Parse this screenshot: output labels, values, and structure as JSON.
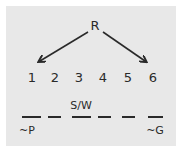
{
  "diagram": {
    "root_label": "R",
    "positions": [
      "1",
      "2",
      "3",
      "4",
      "5",
      "6"
    ],
    "slot_annotations": {
      "above_slot_3": "S/W",
      "below_slot_1": "~P",
      "below_slot_6": "~G"
    },
    "colors": {
      "background": "#e8e8e8",
      "ink": "#2a2a2a"
    }
  }
}
